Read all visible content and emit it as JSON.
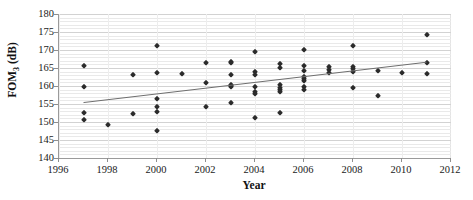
{
  "chart_data": {
    "type": "scatter",
    "title": "",
    "xlabel": "Year",
    "ylabel": "FOM3 (dB)",
    "ylabel_base": "FOM",
    "ylabel_sub": "3",
    "ylabel_unit": " (dB)",
    "xlim": [
      1996,
      2012
    ],
    "ylim": [
      140,
      180
    ],
    "xticks": [
      1996,
      1998,
      2000,
      2002,
      2004,
      2006,
      2008,
      2010,
      2012
    ],
    "yticks": [
      140,
      145,
      150,
      155,
      160,
      165,
      170,
      175,
      180
    ],
    "x_tick_step": 2,
    "y_tick_step": 5,
    "y_minor_step": 1,
    "grid": "horizontal-major-and-minor",
    "legend": "none",
    "marker": "diamond",
    "marker_color": "#2b2b2b",
    "gridline_color": "#e9e9e9",
    "axis_color": "#9a9a9a",
    "points": [
      [
        1997,
        165.6
      ],
      [
        1997,
        159.7
      ],
      [
        1997,
        152.4
      ],
      [
        1997,
        150.6
      ],
      [
        1998,
        149.3
      ],
      [
        1999,
        163.1
      ],
      [
        1999,
        152.3
      ],
      [
        2000,
        171.2
      ],
      [
        2000,
        163.5
      ],
      [
        2000,
        156.5
      ],
      [
        2000,
        154.3
      ],
      [
        2000,
        152.9
      ],
      [
        2000,
        147.6
      ],
      [
        2001,
        163.3
      ],
      [
        2002,
        166.5
      ],
      [
        2002,
        160.7
      ],
      [
        2002,
        154.3
      ],
      [
        2003,
        163.0
      ],
      [
        2003,
        166.8
      ],
      [
        2003,
        166.3
      ],
      [
        2003,
        160.4
      ],
      [
        2003,
        159.9
      ],
      [
        2003,
        159.6
      ],
      [
        2003,
        155.2
      ],
      [
        2004,
        169.5
      ],
      [
        2004,
        163.9
      ],
      [
        2004,
        163.0
      ],
      [
        2004,
        159.8
      ],
      [
        2004,
        158.3
      ],
      [
        2004,
        157.7
      ],
      [
        2004,
        151.0
      ],
      [
        2005,
        166.2
      ],
      [
        2005,
        165.0
      ],
      [
        2005,
        160.3
      ],
      [
        2005,
        159.5
      ],
      [
        2005,
        158.8
      ],
      [
        2005,
        158.2
      ],
      [
        2005,
        152.6
      ],
      [
        2006,
        170.1
      ],
      [
        2006,
        165.5
      ],
      [
        2006,
        164.3
      ],
      [
        2006,
        162.6
      ],
      [
        2006,
        161.9
      ],
      [
        2006,
        161.4
      ],
      [
        2006,
        159.6
      ],
      [
        2006,
        158.9
      ],
      [
        2007,
        165.2
      ],
      [
        2007,
        164.5
      ],
      [
        2007,
        163.7
      ],
      [
        2008,
        171.0
      ],
      [
        2008,
        165.3
      ],
      [
        2008,
        164.6
      ],
      [
        2008,
        163.9
      ],
      [
        2008,
        159.4
      ],
      [
        2009,
        164.2
      ],
      [
        2009,
        157.1
      ],
      [
        2010,
        163.6
      ],
      [
        2011,
        174.2
      ],
      [
        2011,
        166.5
      ],
      [
        2011,
        163.2
      ]
    ],
    "trendline": {
      "visible": true,
      "color": "#6e6e6e",
      "x_start": 1997,
      "y_start": 155.4,
      "x_end": 2011,
      "y_end": 166.6
    }
  }
}
